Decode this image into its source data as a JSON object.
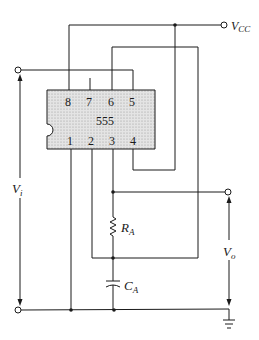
{
  "diagram": {
    "chip": {
      "label": "555",
      "pins_top": [
        "8",
        "7",
        "6",
        "5"
      ],
      "pins_bottom": [
        "1",
        "2",
        "3",
        "4"
      ],
      "fill_color": "#d9d9d9"
    },
    "labels": {
      "vcc": "V",
      "vcc_sub": "CC",
      "vi": "V",
      "vi_sub": "i",
      "vo": "V",
      "vo_sub": "o",
      "ra": "R",
      "ra_sub": "A",
      "ca": "C",
      "ca_sub": "A"
    },
    "components": [
      "resistor R_A",
      "capacitor C_A",
      "ground"
    ],
    "terminals": [
      "Vcc",
      "Vi top",
      "Vi bottom",
      "Vo"
    ]
  }
}
